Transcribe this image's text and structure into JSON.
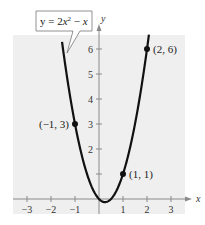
{
  "chart_data": {
    "type": "line",
    "title": "",
    "equation_label": "y = 2x² − x",
    "equation_parts": {
      "lhs": "y = 2",
      "var1": "x",
      "exp": "2",
      "minus": " − ",
      "var2": "x"
    },
    "xlabel": "x",
    "ylabel": "y",
    "xlim": [
      -3.6,
      3.6
    ],
    "ylim": [
      -0.6,
      6.6
    ],
    "x_ticks": [
      -3,
      -2,
      -1,
      1,
      2,
      3
    ],
    "x_tick_labels": [
      "−3",
      "−2",
      "−1",
      "1",
      "2",
      "3"
    ],
    "y_ticks": [
      1,
      2,
      3,
      4,
      5,
      6
    ],
    "y_tick_labels": [
      "",
      "2",
      "3",
      "4",
      "5",
      "6"
    ],
    "grid": false,
    "background": "#efefef",
    "series": [
      {
        "name": "y = 2x^2 - x",
        "function": "2x^2 - x",
        "x_range": [
          -1.54,
          2.08
        ],
        "vertex": [
          0.25,
          -0.125
        ],
        "color": "#111111"
      }
    ],
    "points": [
      {
        "x": -1,
        "y": 3,
        "label": "(−1, 3)",
        "label_side": "left"
      },
      {
        "x": 1,
        "y": 1,
        "label": "(1, 1)",
        "label_side": "right"
      },
      {
        "x": 2,
        "y": 6,
        "label": "(2, 6)",
        "label_side": "right"
      }
    ]
  }
}
